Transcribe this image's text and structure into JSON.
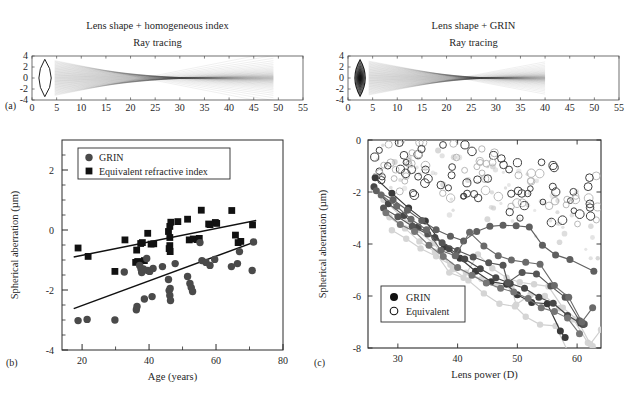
{
  "figure": {
    "panel_labels": {
      "a": "(a)",
      "b": "(b)",
      "c": "(c)"
    }
  },
  "raytrace_left": {
    "title": "Lens shape + homogeneous index",
    "subtitle": "Ray tracing",
    "xticks": [
      "0",
      "5",
      "10",
      "15",
      "20",
      "25",
      "30",
      "35",
      "40",
      "45",
      "50",
      "55"
    ],
    "yticks": [
      "4",
      "2",
      "0",
      "-2",
      "-4"
    ],
    "xlim": [
      0,
      55
    ],
    "ylim": [
      -4,
      4
    ],
    "lens_front": 0.6,
    "lens_back": 4.6,
    "lens_semiheight": 3.4,
    "ray_end": 49,
    "focus_x": 34,
    "grin": false
  },
  "raytrace_right": {
    "title": "Lens shape + GRIN",
    "subtitle": "Ray tracing",
    "xticks": [
      "0",
      "5",
      "10",
      "15",
      "20",
      "25",
      "30",
      "35",
      "40",
      "45",
      "50",
      "55"
    ],
    "yticks": [
      "4",
      "2",
      "0",
      "-2",
      "-4"
    ],
    "xlim": [
      0,
      55
    ],
    "ylim": [
      -4,
      4
    ],
    "lens_front": 0.7,
    "lens_back": 4.2,
    "lens_semiheight": 3.3,
    "ray_end": 40,
    "focus_x": 30,
    "grin": true
  },
  "chart_data": [
    {
      "id": "panel_b",
      "type": "scatter",
      "title": "",
      "xlabel": "Age (years)",
      "ylabel": "Spherical aberration (µm)",
      "xlim": [
        14,
        80
      ],
      "ylim": [
        -4,
        3
      ],
      "xticks": [
        20,
        40,
        60,
        80
      ],
      "yticks": [
        2,
        0,
        -2,
        -4
      ],
      "xtick_labels": [
        "20",
        "40",
        "60",
        "80"
      ],
      "ytick_labels": [
        "2",
        "0",
        "-2",
        "-4"
      ],
      "xminor": [
        30,
        50,
        70
      ],
      "yminor": [
        2.5,
        1.5,
        1,
        0.5,
        -0.5,
        -1,
        -1.5,
        -2.5,
        -3,
        -3.5
      ],
      "grid": false,
      "legend_position": "top-left",
      "legend": [
        {
          "label": "GRIN",
          "marker": "filled-circle",
          "color": "#4a4a4a"
        },
        {
          "label": "Equivalent refractive index",
          "marker": "filled-square",
          "color": "#111111"
        }
      ],
      "series": [
        {
          "name": "Equivalent refractive index",
          "marker": "filled-square",
          "color": "#111111",
          "points": [
            [
              18.8,
              -0.6
            ],
            [
              21.8,
              -0.88
            ],
            [
              29.8,
              -1.38
            ],
            [
              32.8,
              -0.33
            ],
            [
              36.3,
              -0.67
            ],
            [
              36.6,
              -1.05
            ],
            [
              37.5,
              -0.45
            ],
            [
              38.0,
              -0.42
            ],
            [
              38.6,
              -1.02
            ],
            [
              39.6,
              -0.11
            ],
            [
              40.6,
              -0.47
            ],
            [
              41.4,
              -0.46
            ],
            [
              45.8,
              -0.05
            ],
            [
              46.2,
              0.12
            ],
            [
              46.2,
              -0.25
            ],
            [
              46.2,
              -0.52
            ],
            [
              46.3,
              -0.72
            ],
            [
              46.5,
              0.26
            ],
            [
              48.6,
              0.28
            ],
            [
              51.5,
              0.36
            ],
            [
              52.0,
              -0.33
            ],
            [
              53.2,
              -0.3
            ],
            [
              54.4,
              -0.32
            ],
            [
              55.0,
              -0.28
            ],
            [
              55.6,
              0.66
            ],
            [
              57.8,
              0.2
            ],
            [
              58.2,
              0.18
            ],
            [
              59.8,
              0.25
            ],
            [
              60.2,
              0.22
            ],
            [
              64.7,
              0.65
            ],
            [
              65.8,
              -0.17
            ],
            [
              66.6,
              -0.42
            ],
            [
              67.4,
              -0.38
            ],
            [
              70.9,
              0.17
            ],
            [
              36.0,
              -1.08
            ],
            [
              46.0,
              -0.62
            ]
          ]
        },
        {
          "name": "GRIN",
          "marker": "filled-circle",
          "color": "#4a4a4a",
          "points": [
            [
              18.8,
              -3.02
            ],
            [
              21.5,
              -2.98
            ],
            [
              29.8,
              -3.0
            ],
            [
              32.6,
              -1.4
            ],
            [
              36.2,
              -2.66
            ],
            [
              36.4,
              -2.55
            ],
            [
              37.2,
              -1.18
            ],
            [
              37.6,
              -1.3
            ],
            [
              37.8,
              -1.42
            ],
            [
              38.3,
              -1.3
            ],
            [
              38.6,
              -2.3
            ],
            [
              39.3,
              -0.95
            ],
            [
              39.6,
              -1.35
            ],
            [
              40.2,
              -1.38
            ],
            [
              40.9,
              -2.22
            ],
            [
              41.2,
              -1.28
            ],
            [
              44.0,
              -1.22
            ],
            [
              45.8,
              -1.65
            ],
            [
              46.0,
              -2.02
            ],
            [
              46.2,
              -2.18
            ],
            [
              46.3,
              -1.95
            ],
            [
              46.4,
              -2.35
            ],
            [
              47.8,
              -1.12
            ],
            [
              51.5,
              -1.55
            ],
            [
              52.2,
              -1.78
            ],
            [
              52.6,
              -1.92
            ],
            [
              53.0,
              -2.05
            ],
            [
              55.2,
              -0.42
            ],
            [
              55.8,
              -1.02
            ],
            [
              57.0,
              -1.08
            ],
            [
              58.2,
              -1.18
            ],
            [
              59.6,
              -0.98
            ],
            [
              64.6,
              -1.22
            ],
            [
              66.4,
              -1.12
            ],
            [
              67.0,
              -0.72
            ],
            [
              70.8,
              -1.35
            ],
            [
              71.2,
              -0.4
            ]
          ]
        }
      ],
      "fit_lines": [
        {
          "name": "Equivalent refractive index fit",
          "x0": 17.5,
          "y0": -0.9,
          "x1": 72.0,
          "y1": 0.32,
          "color": "#111111"
        },
        {
          "name": "GRIN fit",
          "x0": 17.5,
          "y0": -2.62,
          "x1": 72.0,
          "y1": -0.38,
          "color": "#111111"
        }
      ]
    },
    {
      "id": "panel_c",
      "type": "scatter",
      "title": "",
      "xlabel": "Lens power (D)",
      "ylabel": "Spherical aberration (µm)",
      "xlim": [
        25,
        64
      ],
      "ylim": [
        -8,
        0
      ],
      "xticks": [
        30,
        40,
        50,
        60
      ],
      "yticks": [
        0,
        -2,
        -4,
        -6,
        -8
      ],
      "xtick_labels": [
        "30",
        "40",
        "50",
        "60"
      ],
      "ytick_labels": [
        "0",
        "-2",
        "-4",
        "-6",
        "-8"
      ],
      "grid": false,
      "legend_position": "bottom-left",
      "legend": [
        {
          "label": "GRIN",
          "marker": "filled-circle",
          "color": "#111111"
        },
        {
          "label": "Equivalent",
          "marker": "open-circle",
          "color": "#111111"
        }
      ],
      "grin_tracks": [
        {
          "shade": "#3a3a3a",
          "points": [
            [
              26.2,
              -1.45
            ],
            [
              29.0,
              -2.05
            ],
            [
              31.8,
              -2.62
            ],
            [
              34.6,
              -3.12
            ],
            [
              37.8,
              -4.12
            ],
            [
              40.4,
              -4.55
            ],
            [
              43.0,
              -5.05
            ],
            [
              45.6,
              -5.45
            ],
            [
              48.2,
              -5.55
            ],
            [
              50.0,
              -5.95
            ],
            [
              52.4,
              -6.25
            ],
            [
              55.0,
              -6.3
            ],
            [
              57.2,
              -7.35
            ],
            [
              58.0,
              -7.6
            ]
          ]
        },
        {
          "shade": "#474747",
          "points": [
            [
              26.0,
              -1.8
            ],
            [
              28.4,
              -2.45
            ],
            [
              31.0,
              -2.9
            ],
            [
              33.4,
              -3.35
            ],
            [
              36.2,
              -3.75
            ],
            [
              38.6,
              -4.18
            ],
            [
              41.2,
              -4.58
            ],
            [
              43.8,
              -4.95
            ],
            [
              46.4,
              -5.3
            ],
            [
              48.8,
              -5.52
            ],
            [
              51.2,
              -5.7
            ],
            [
              53.6,
              -6.05
            ],
            [
              56.0,
              -6.28
            ],
            [
              58.4,
              -6.75
            ],
            [
              60.6,
              -7.05
            ],
            [
              61.0,
              -7.1
            ]
          ]
        },
        {
          "shade": "#555555",
          "points": [
            [
              27.6,
              -2.62
            ],
            [
              30.0,
              -2.95
            ],
            [
              32.4,
              -3.32
            ],
            [
              35.0,
              -3.62
            ],
            [
              37.4,
              -3.95
            ],
            [
              40.0,
              -4.25
            ],
            [
              42.6,
              -4.5
            ],
            [
              45.2,
              -4.72
            ],
            [
              47.6,
              -4.82
            ],
            [
              48.4,
              -5.48
            ],
            [
              50.8,
              -5.1
            ],
            [
              53.2,
              -5.15
            ],
            [
              55.6,
              -5.62
            ],
            [
              58.0,
              -6.05
            ],
            [
              60.4,
              -6.95
            ],
            [
              61.2,
              -7.08
            ]
          ]
        },
        {
          "shade": "#5f5f5f",
          "points": [
            [
              26.4,
              -1.95
            ],
            [
              29.2,
              -2.3
            ],
            [
              31.6,
              -2.7
            ],
            [
              34.0,
              -3.1
            ],
            [
              36.4,
              -3.45
            ],
            [
              38.8,
              -3.7
            ],
            [
              41.0,
              -3.88
            ],
            [
              43.2,
              -3.52
            ],
            [
              45.4,
              -3.32
            ],
            [
              47.6,
              -3.28
            ],
            [
              49.8,
              -3.3
            ],
            [
              52.0,
              -3.35
            ],
            [
              54.2,
              -4.05
            ],
            [
              56.4,
              -4.42
            ],
            [
              58.8,
              -4.6
            ],
            [
              62.8,
              -5.05
            ]
          ]
        },
        {
          "shade": "#6a6a6a",
          "points": [
            [
              27.2,
              -2.12
            ],
            [
              29.8,
              -2.55
            ],
            [
              32.2,
              -3.05
            ],
            [
              34.8,
              -3.45
            ],
            [
              37.2,
              -4.25
            ],
            [
              39.6,
              -4.45
            ],
            [
              42.0,
              -3.55
            ],
            [
              44.4,
              -4.08
            ],
            [
              46.8,
              -4.45
            ],
            [
              49.0,
              -4.62
            ],
            [
              51.4,
              -4.7
            ],
            [
              53.8,
              -4.78
            ],
            [
              56.2,
              -5.6
            ],
            [
              58.6,
              -6.05
            ],
            [
              60.8,
              -7.0
            ],
            [
              62.6,
              -6.45
            ]
          ]
        },
        {
          "shade": "#767676",
          "points": [
            [
              28.0,
              -2.8
            ],
            [
              30.4,
              -3.25
            ],
            [
              32.8,
              -3.52
            ],
            [
              35.2,
              -4.05
            ],
            [
              37.6,
              -4.48
            ],
            [
              40.0,
              -4.9
            ],
            [
              42.4,
              -5.2
            ],
            [
              44.8,
              -5.5
            ],
            [
              47.2,
              -5.7
            ],
            [
              49.4,
              -5.85
            ],
            [
              51.8,
              -6.1
            ],
            [
              54.0,
              -6.45
            ],
            [
              56.2,
              -6.6
            ],
            [
              58.4,
              -6.85
            ],
            [
              60.4,
              -7.45
            ]
          ]
        }
      ],
      "equivalent_cloud_count": 118,
      "equivalent_range": {
        "x": [
          25.5,
          63.5
        ],
        "y": [
          -4.6,
          -0.1
        ]
      }
    }
  ]
}
